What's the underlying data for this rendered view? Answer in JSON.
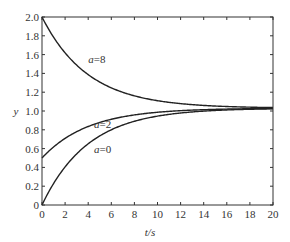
{
  "chart_data": {
    "type": "line",
    "title": "",
    "xlabel": "t/s",
    "ylabel": "y",
    "xlim": [
      0,
      20
    ],
    "ylim": [
      0,
      2.0
    ],
    "grid": false,
    "legend": "none (curves labeled inline)",
    "x_ticks": [
      "0",
      "2",
      "4",
      "6",
      "8",
      "10",
      "12",
      "14",
      "16",
      "18",
      "20"
    ],
    "y_ticks": [
      "0",
      "0.2",
      "0.4",
      "0.6",
      "0.8",
      "1.0",
      "1.2",
      "1.4",
      "1.6",
      "1.8",
      "2.0"
    ],
    "x": [
      0,
      2,
      4,
      6,
      8,
      10,
      12,
      14,
      16,
      18,
      20
    ],
    "series": [
      {
        "name": "a=8",
        "values": [
          2.0,
          1.62,
          1.39,
          1.25,
          1.16,
          1.11,
          1.08,
          1.06,
          1.05,
          1.04,
          1.03
        ]
      },
      {
        "name": "a=2",
        "values": [
          0.5,
          0.71,
          0.83,
          0.91,
          0.96,
          0.99,
          1.01,
          1.02,
          1.02,
          1.03,
          1.03
        ]
      },
      {
        "name": "a=0",
        "values": [
          0.0,
          0.41,
          0.66,
          0.8,
          0.89,
          0.95,
          0.98,
          1.0,
          1.01,
          1.02,
          1.03
        ]
      }
    ],
    "annotations": [
      {
        "text": "a=8",
        "x": 4.0,
        "y": 1.55
      },
      {
        "text": "a=2",
        "x": 4.5,
        "y": 0.86
      },
      {
        "text": "a=0",
        "x": 4.5,
        "y": 0.6
      }
    ]
  }
}
